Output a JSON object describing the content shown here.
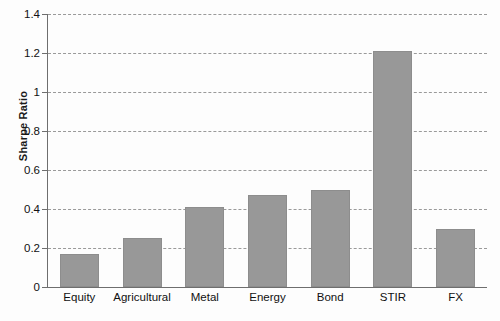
{
  "chart_data": {
    "type": "bar",
    "title": "",
    "xlabel": "",
    "ylabel": "Sharpe Ratio",
    "categories": [
      "Equity",
      "Agricultural",
      "Metal",
      "Energy",
      "Bond",
      "STIR",
      "FX"
    ],
    "values": [
      0.17,
      0.25,
      0.41,
      0.47,
      0.5,
      1.21,
      0.3
    ],
    "ylim": [
      0,
      1.4
    ],
    "yticks": [
      0,
      0.2,
      0.4,
      0.6,
      0.8,
      1,
      1.2,
      1.4
    ],
    "ytick_labels": [
      "0",
      "0.2",
      "0.4",
      "0.6",
      "0.8",
      "1",
      "1.2",
      "1.4"
    ],
    "grid": true,
    "grid_style": "dashed-horizontal",
    "legend": "none",
    "bar_color": "#989898"
  }
}
